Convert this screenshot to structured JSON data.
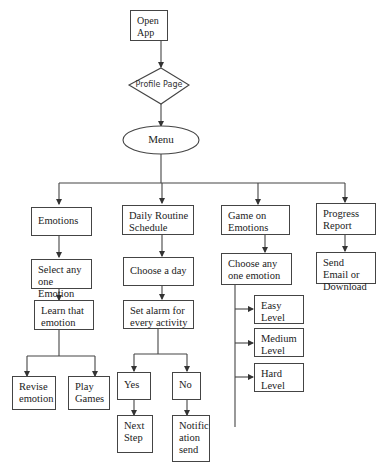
{
  "diagram": {
    "type": "flowchart",
    "nodes": {
      "open_app": "Open App",
      "profile_page": "Profile Page",
      "menu": "Menu",
      "emotions": "Emotions",
      "select_emotion": "Select any one Emotion",
      "learn_emotion": "Learn that emotion",
      "revise_emotion": "Revise emotion",
      "play_games": "Play Games",
      "daily_routine": "Daily Routine Schedule",
      "choose_day": "Choose a day",
      "set_alarm": "Set alarm for every activity",
      "yes": "Yes",
      "no": "No",
      "next_step": "Next Step",
      "notification_send": "Notific ation send",
      "game_emotions": "Game on Emotions",
      "choose_emotion": "Choose any one emotion",
      "easy_level": "Easy Level",
      "medium_level": "Medium Level",
      "hard_level": "Hard Level",
      "progress_report": "Progress Report",
      "send_email": "Send Email or Download"
    },
    "edges": [
      [
        "open_app",
        "profile_page"
      ],
      [
        "profile_page",
        "menu"
      ],
      [
        "menu",
        "emotions"
      ],
      [
        "menu",
        "daily_routine"
      ],
      [
        "menu",
        "game_emotions"
      ],
      [
        "menu",
        "progress_report"
      ],
      [
        "emotions",
        "select_emotion"
      ],
      [
        "select_emotion",
        "learn_emotion"
      ],
      [
        "learn_emotion",
        "revise_emotion"
      ],
      [
        "learn_emotion",
        "play_games"
      ],
      [
        "daily_routine",
        "choose_day"
      ],
      [
        "choose_day",
        "set_alarm"
      ],
      [
        "set_alarm",
        "yes"
      ],
      [
        "set_alarm",
        "no"
      ],
      [
        "yes",
        "next_step"
      ],
      [
        "no",
        "notification_send"
      ],
      [
        "game_emotions",
        "choose_emotion"
      ],
      [
        "choose_emotion",
        "easy_level"
      ],
      [
        "choose_emotion",
        "medium_level"
      ],
      [
        "choose_emotion",
        "hard_level"
      ],
      [
        "progress_report",
        "send_email"
      ]
    ],
    "colors": {
      "stroke": "#444444",
      "fill": "#ffffff",
      "text": "#222222"
    }
  }
}
